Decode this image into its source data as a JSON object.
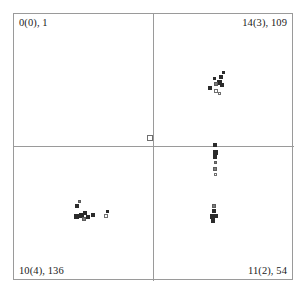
{
  "chart_data": {
    "type": "scatter",
    "title": "",
    "xlabel": "",
    "ylabel": "",
    "grid": false,
    "legend": null,
    "axis_style": "quadrant-cross",
    "xlim": [
      0,
      280
    ],
    "ylim": [
      0,
      267
    ],
    "quadrant_labels": {
      "top_left": "0(0), 1",
      "top_right": "14(3), 109",
      "bottom_left": "10(4), 136",
      "bottom_right": "11(2), 54"
    },
    "marker_shape": "square",
    "marker_size_px": 4,
    "colors": {
      "frame": "#9a9a9a",
      "divider": "#9a9a9a",
      "marker_filled": "#2b2b2b",
      "marker_hollow_edge": "#6f6f6f",
      "marker_semi": "#7d7d7d",
      "background": "#ffffff",
      "label_text": "#1a1a1a"
    },
    "series": [
      {
        "name": "top-right-cluster",
        "quadrant": "top_right",
        "count": 9,
        "points": [
          {
            "x": 205,
            "y": 61,
            "style": "filled",
            "size": 4
          },
          {
            "x": 208,
            "y": 57,
            "style": "filled",
            "size": 3
          },
          {
            "x": 203,
            "y": 66,
            "style": "filled",
            "size": 5
          },
          {
            "x": 200,
            "y": 68,
            "style": "semi",
            "size": 4
          },
          {
            "x": 206,
            "y": 69,
            "style": "filled",
            "size": 4
          },
          {
            "x": 194,
            "y": 72,
            "style": "filled",
            "size": 4
          },
          {
            "x": 200,
            "y": 75,
            "style": "hollow",
            "size": 4
          },
          {
            "x": 204,
            "y": 78,
            "style": "hollow",
            "size": 3
          },
          {
            "x": 199,
            "y": 63,
            "style": "filled",
            "size": 3
          }
        ]
      },
      {
        "name": "center-isolated-point",
        "quadrant": "boundary",
        "count": 1,
        "points": [
          {
            "x": 133,
            "y": 121,
            "style": "hollow",
            "size": 6
          }
        ]
      },
      {
        "name": "bottom-right-upper-chain",
        "quadrant": "bottom_right",
        "count": 6,
        "points": [
          {
            "x": 199,
            "y": 129,
            "style": "filled",
            "size": 4
          },
          {
            "x": 199,
            "y": 136,
            "style": "filled",
            "size": 5
          },
          {
            "x": 199,
            "y": 141,
            "style": "filled",
            "size": 4
          },
          {
            "x": 200,
            "y": 147,
            "style": "semi",
            "size": 3
          },
          {
            "x": 199,
            "y": 153,
            "style": "semi",
            "size": 4
          },
          {
            "x": 200,
            "y": 159,
            "style": "hollow",
            "size": 3
          }
        ]
      },
      {
        "name": "bottom-right-lower-cluster",
        "quadrant": "bottom_right",
        "count": 5,
        "points": [
          {
            "x": 198,
            "y": 190,
            "style": "semi",
            "size": 4
          },
          {
            "x": 198,
            "y": 195,
            "style": "filled",
            "size": 4
          },
          {
            "x": 196,
            "y": 200,
            "style": "filled",
            "size": 5
          },
          {
            "x": 200,
            "y": 200,
            "style": "filled",
            "size": 4
          },
          {
            "x": 197,
            "y": 205,
            "style": "filled",
            "size": 4
          }
        ]
      },
      {
        "name": "bottom-left-cluster",
        "quadrant": "bottom_left",
        "count": 10,
        "points": [
          {
            "x": 61,
            "y": 190,
            "style": "filled",
            "size": 4
          },
          {
            "x": 64,
            "y": 186,
            "style": "semi",
            "size": 3
          },
          {
            "x": 60,
            "y": 200,
            "style": "filled",
            "size": 5
          },
          {
            "x": 65,
            "y": 199,
            "style": "filled",
            "size": 5
          },
          {
            "x": 69,
            "y": 197,
            "style": "filled",
            "size": 4
          },
          {
            "x": 72,
            "y": 201,
            "style": "filled",
            "size": 4
          },
          {
            "x": 68,
            "y": 203,
            "style": "semi",
            "size": 4
          },
          {
            "x": 77,
            "y": 199,
            "style": "filled",
            "size": 4
          },
          {
            "x": 90,
            "y": 200,
            "style": "hollow",
            "size": 4
          },
          {
            "x": 92,
            "y": 196,
            "style": "filled",
            "size": 3
          }
        ]
      }
    ]
  }
}
